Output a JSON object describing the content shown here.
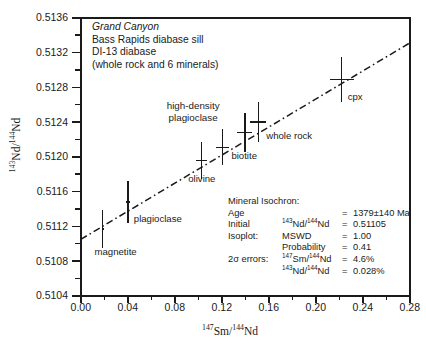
{
  "caption": {
    "line1": "Grand Canyon",
    "line2": "Bass Rapids diabase sill",
    "line3": "DI-13 diabase",
    "line4": "(whole rock and 6 minerals)"
  },
  "stats": {
    "title": "Mineral Isochron:",
    "rows": [
      {
        "label": "Age",
        "sub": "",
        "eq": "=",
        "value": "1379±140 Ma"
      },
      {
        "label": "Initial",
        "sub": "143Nd/144Nd",
        "eq": "=",
        "value": "0.51105"
      },
      {
        "label": "Isoplot:",
        "sub": "MSWD",
        "eq": "=",
        "value": "1.00"
      },
      {
        "label": "",
        "sub": "Probability",
        "eq": "=",
        "value": "0.41"
      },
      {
        "label": "2σ errors:",
        "sub": "147Sm/144Nd",
        "eq": "=",
        "value": "4.6%"
      },
      {
        "label": "",
        "sub": "143Nd/144Nd",
        "eq": "=",
        "value": "0.028%"
      }
    ]
  },
  "chart_data": {
    "type": "scatter",
    "xlabel": "147Sm/144Nd",
    "ylabel": "143Nd/144Nd",
    "xlim": [
      0.0,
      0.28
    ],
    "ylim": [
      0.5104,
      0.5136
    ],
    "xticks": [
      "0.00",
      "0.04",
      "0.08",
      "0.12",
      "0.16",
      "0.20",
      "0.24",
      "0.28"
    ],
    "xtick_values": [
      0.0,
      0.04,
      0.08,
      0.12,
      0.16,
      0.2,
      0.24,
      0.28
    ],
    "xminor_step": 0.02,
    "yticks": [
      "0.5136",
      "0.5132",
      "0.5128",
      "0.5124",
      "0.5120",
      "0.5116",
      "0.5112",
      "0.5108",
      "0.5104"
    ],
    "ytick_values": [
      0.5136,
      0.5132,
      0.5128,
      0.5124,
      0.512,
      0.5116,
      0.5112,
      0.5108,
      0.5104
    ],
    "yminor_step": 0.0002,
    "grid": false,
    "legend": "none",
    "points": [
      {
        "name": "magnetite",
        "x": 0.0185,
        "y": 0.51117,
        "xerr": 0.00085,
        "yerr": 0.00022,
        "label": "magnetite",
        "label_pos": "below-right"
      },
      {
        "name": "plagioclase",
        "x": 0.04,
        "y": 0.51148,
        "xerr": 0.00185,
        "yerr": 0.00024,
        "label": "plagioclase",
        "label_pos": "below-right"
      },
      {
        "name": "olivine",
        "x": 0.1025,
        "y": 0.51196,
        "xerr": 0.0047,
        "yerr": 0.00021,
        "label": "olivine",
        "label_pos": "below"
      },
      {
        "name": "biotite",
        "x": 0.1205,
        "y": 0.51211,
        "xerr": 0.0056,
        "yerr": 0.00021,
        "label": "biotite",
        "label_pos": "right"
      },
      {
        "name": "high-density plagioclase",
        "x": 0.1395,
        "y": 0.51228,
        "xerr": 0.0064,
        "yerr": 0.00022,
        "label": "high-density plagioclase",
        "label_pos": "above-left"
      },
      {
        "name": "whole rock",
        "x": 0.151,
        "y": 0.5124,
        "xerr": 0.0069,
        "yerr": 0.00023,
        "label": "whole rock",
        "label_pos": "below-right"
      },
      {
        "name": "cpx",
        "x": 0.222,
        "y": 0.51289,
        "xerr": 0.0102,
        "yerr": 0.00026,
        "label": "cpx",
        "label_pos": "below-right"
      }
    ],
    "fit_line": {
      "style": "dash-dot",
      "intercept": 0.51105,
      "slope": 0.008075,
      "x_start": 0.0,
      "x_end": 0.28,
      "age": "1379±140 Ma",
      "mswd": 1.0,
      "probability": 0.41
    }
  },
  "point_labels": {
    "magnetite": "magnetite",
    "plagioclase": "plagioclase",
    "olivine": "olivine",
    "biotite": "biotite",
    "hd_plag_line1": "high-density",
    "hd_plag_line2": "plagioclase",
    "whole_rock": "whole rock",
    "cpx": "cpx"
  }
}
